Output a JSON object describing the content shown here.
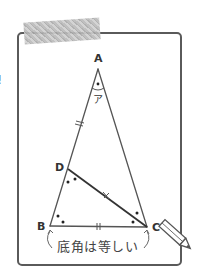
{
  "figure": {
    "type": "isosceles triangle diagram",
    "vertices": {
      "A": "A",
      "B": "B",
      "C": "C",
      "D": "D"
    },
    "angle_label": "ア",
    "caption": "底角は等しい",
    "side_glyph": "!",
    "tick_marks": {
      "AD": "double",
      "BC": "double",
      "DC": "x-cross"
    },
    "angle_marks": {
      "A": "single-dot",
      "D": "double-dot",
      "B": "double-dot",
      "C": "double-dot"
    },
    "icons": {
      "pencil": "pencil-icon",
      "tape": "masking-tape"
    },
    "colors": {
      "line": "#555555",
      "frame": "#5a5a5a",
      "tape": "#bdbdbd",
      "text": "#333333"
    }
  }
}
